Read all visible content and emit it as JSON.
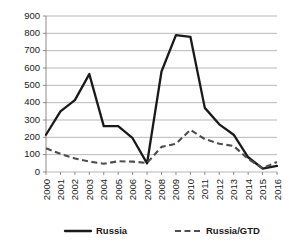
{
  "chart_data": {
    "type": "line",
    "title": "",
    "xlabel": "",
    "ylabel": "",
    "categories": [
      "2000",
      "2001",
      "2002",
      "2003",
      "2004",
      "2005",
      "2006",
      "2007",
      "2008",
      "2009",
      "2010",
      "2011",
      "2012",
      "2013",
      "2014",
      "2015",
      "2016"
    ],
    "yticks": [
      "0",
      "100",
      "200",
      "300",
      "400",
      "500",
      "600",
      "700",
      "800",
      "900"
    ],
    "ylim": [
      0,
      900
    ],
    "grid": true,
    "legend_position": "bottom",
    "series": [
      {
        "name": "Russia",
        "style": "solid",
        "color": "#1a1a1a",
        "values": [
          215,
          350,
          415,
          565,
          265,
          265,
          195,
          50,
          580,
          790,
          780,
          370,
          275,
          215,
          85,
          20,
          35
        ]
      },
      {
        "name": "Russia/GTD",
        "style": "dashed",
        "color": "#4d4d4d",
        "values": [
          137,
          105,
          78,
          60,
          48,
          62,
          60,
          52,
          145,
          163,
          243,
          190,
          163,
          150,
          75,
          22,
          58
        ]
      }
    ]
  },
  "legend": {
    "items": [
      {
        "label": "Russia"
      },
      {
        "label": "Russia/GTD"
      }
    ]
  }
}
